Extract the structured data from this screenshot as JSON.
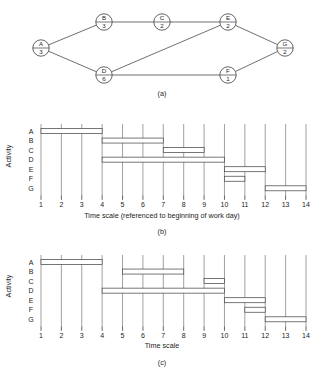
{
  "panel_a": {
    "caption": "(a)",
    "type": "activity-on-node-network",
    "nodes": [
      {
        "id": "A",
        "label": "A",
        "duration": "3",
        "cx": 41,
        "cy": 48
      },
      {
        "id": "B",
        "label": "B",
        "duration": "3",
        "cx": 104,
        "cy": 22
      },
      {
        "id": "C",
        "label": "C",
        "duration": "2",
        "cx": 162,
        "cy": 22
      },
      {
        "id": "D",
        "label": "D",
        "duration": "6",
        "cx": 104,
        "cy": 75
      },
      {
        "id": "E",
        "label": "E",
        "duration": "2",
        "cx": 228,
        "cy": 22
      },
      {
        "id": "F",
        "label": "F",
        "duration": "1",
        "cx": 228,
        "cy": 75
      },
      {
        "id": "G",
        "label": "G",
        "duration": "2",
        "cx": 285,
        "cy": 48
      }
    ],
    "edges": [
      {
        "from": "A",
        "to": "B"
      },
      {
        "from": "A",
        "to": "D"
      },
      {
        "from": "B",
        "to": "C"
      },
      {
        "from": "C",
        "to": "E"
      },
      {
        "from": "D",
        "to": "E"
      },
      {
        "from": "D",
        "to": "F"
      },
      {
        "from": "E",
        "to": "G"
      },
      {
        "from": "F",
        "to": "G"
      }
    ]
  },
  "panel_b": {
    "caption": "(b)",
    "y_axis_title": "Activity",
    "x_axis_title": "Time scale (referenced to beginning of work day)",
    "row_labels": [
      "A",
      "B",
      "C",
      "D",
      "E",
      "F",
      "G"
    ],
    "tick_labels": [
      "1",
      "2",
      "3",
      "4",
      "5",
      "6",
      "7",
      "8",
      "9",
      "10",
      "11",
      "12",
      "13",
      "14"
    ],
    "bars": [
      {
        "activity": "A",
        "start": 1,
        "end": 4
      },
      {
        "activity": "B",
        "start": 4,
        "end": 7
      },
      {
        "activity": "C",
        "start": 7,
        "end": 9
      },
      {
        "activity": "D",
        "start": 4,
        "end": 10
      },
      {
        "activity": "E",
        "start": 10,
        "end": 12
      },
      {
        "activity": "F",
        "start": 10,
        "end": 11
      },
      {
        "activity": "G",
        "start": 12,
        "end": 14
      }
    ]
  },
  "panel_c": {
    "caption": "(c)",
    "y_axis_title": "Activity",
    "x_axis_title": "Time scale",
    "row_labels": [
      "A",
      "B",
      "C",
      "D",
      "E",
      "F",
      "G"
    ],
    "tick_labels": [
      "1",
      "2",
      "3",
      "4",
      "5",
      "6",
      "7",
      "8",
      "9",
      "10",
      "11",
      "12",
      "13",
      "14"
    ],
    "bars": [
      {
        "activity": "A",
        "start": 1,
        "end": 4
      },
      {
        "activity": "B",
        "start": 5,
        "end": 8
      },
      {
        "activity": "C",
        "start": 9,
        "end": 10
      },
      {
        "activity": "D",
        "start": 4,
        "end": 10
      },
      {
        "activity": "E",
        "start": 10,
        "end": 12
      },
      {
        "activity": "F",
        "start": 11,
        "end": 12
      },
      {
        "activity": "G",
        "start": 12,
        "end": 14
      }
    ]
  },
  "chart_data": [
    {
      "type": "bar",
      "orientation": "horizontal-gantt",
      "title": "(b)",
      "xlabel": "Time scale (referenced to beginning of work day)",
      "ylabel": "Activity",
      "xlim": [
        1,
        14
      ],
      "grid": true,
      "categories": [
        "A",
        "B",
        "C",
        "D",
        "E",
        "F",
        "G"
      ],
      "bars": [
        {
          "category": "A",
          "start": 1,
          "end": 4,
          "duration": 3
        },
        {
          "category": "B",
          "start": 4,
          "end": 7,
          "duration": 3
        },
        {
          "category": "C",
          "start": 7,
          "end": 9,
          "duration": 2
        },
        {
          "category": "D",
          "start": 4,
          "end": 10,
          "duration": 6
        },
        {
          "category": "E",
          "start": 10,
          "end": 12,
          "duration": 2
        },
        {
          "category": "F",
          "start": 10,
          "end": 11,
          "duration": 1
        },
        {
          "category": "G",
          "start": 12,
          "end": 14,
          "duration": 2
        }
      ]
    },
    {
      "type": "bar",
      "orientation": "horizontal-gantt",
      "title": "(c)",
      "xlabel": "Time scale",
      "ylabel": "Activity",
      "xlim": [
        1,
        14
      ],
      "grid": true,
      "categories": [
        "A",
        "B",
        "C",
        "D",
        "E",
        "F",
        "G"
      ],
      "bars": [
        {
          "category": "A",
          "start": 1,
          "end": 4,
          "duration": 3
        },
        {
          "category": "B",
          "start": 5,
          "end": 8,
          "duration": 3
        },
        {
          "category": "C",
          "start": 9,
          "end": 10,
          "duration": 1
        },
        {
          "category": "D",
          "start": 4,
          "end": 10,
          "duration": 6
        },
        {
          "category": "E",
          "start": 10,
          "end": 12,
          "duration": 2
        },
        {
          "category": "F",
          "start": 11,
          "end": 12,
          "duration": 1
        },
        {
          "category": "G",
          "start": 12,
          "end": 14,
          "duration": 2
        }
      ]
    }
  ]
}
